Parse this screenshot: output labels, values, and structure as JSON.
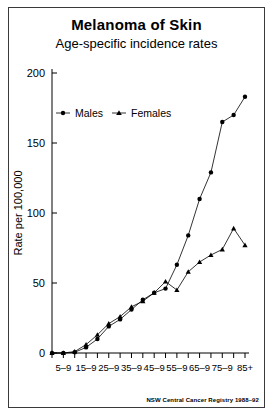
{
  "figure": {
    "title": "Melanoma of Skin",
    "subtitle": "Age-specific incidence rates",
    "credit": "NSW Central Cancer Registry 1988–92"
  },
  "legend": {
    "males_label": "Males",
    "females_label": "Females",
    "males_marker": "filled-circle",
    "females_marker": "filled-triangle",
    "position": "upper-left-inside"
  },
  "axes": {
    "ylabel": "Rate per 100,000",
    "yticks": [
      "0",
      "50",
      "100",
      "150",
      "200"
    ],
    "xlabels": [
      "5–9",
      "15–9",
      "25–9",
      "35–9",
      "45–9",
      "55–9",
      "65–9",
      "75–9",
      "85+"
    ]
  },
  "colors": {
    "ink": "#000000",
    "frame": "#3a3a3a",
    "background": "#ffffff"
  },
  "chart_data": {
    "type": "line",
    "title": "Melanoma of Skin",
    "subtitle": "Age-specific incidence rates",
    "xlabel": "",
    "ylabel": "Rate per 100,000",
    "ylim": [
      0,
      200
    ],
    "yticks": [
      0,
      50,
      100,
      150,
      200
    ],
    "grid": false,
    "legend_position": "upper left",
    "annotation": "NSW Central Cancer Registry 1988–92",
    "categories": [
      "0–4",
      "5–9",
      "10–14",
      "15–19",
      "20–24",
      "25–29",
      "30–34",
      "35–39",
      "40–44",
      "45–49",
      "50–54",
      "55–59",
      "60–64",
      "65–69",
      "70–74",
      "75–79",
      "80–84",
      "85+"
    ],
    "tick_labels": [
      "",
      "5–9",
      "",
      "15–9",
      "",
      "25–9",
      "",
      "35–9",
      "",
      "45–9",
      "",
      "55–9",
      "",
      "65–9",
      "",
      "75–9",
      "",
      "85+"
    ],
    "series": [
      {
        "name": "Males",
        "marker": "circle",
        "values": [
          0,
          0,
          0.5,
          4,
          10,
          19,
          24,
          31,
          38,
          43,
          46,
          63,
          84,
          110,
          129,
          165,
          170,
          183
        ]
      },
      {
        "name": "Females",
        "marker": "triangle",
        "values": [
          0,
          0,
          1,
          6,
          13,
          21,
          26,
          33,
          37,
          43,
          51,
          45,
          58,
          65,
          70,
          74,
          89,
          77
        ]
      }
    ]
  }
}
